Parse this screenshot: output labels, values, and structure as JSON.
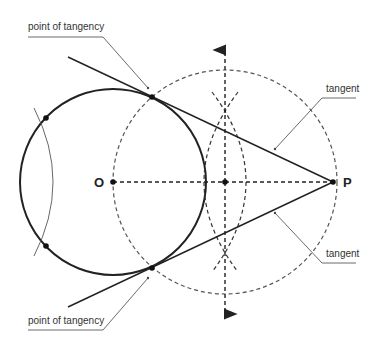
{
  "diagram": {
    "points": {
      "O": {
        "label": "O",
        "x": 113,
        "y": 182
      },
      "P": {
        "label": "P",
        "x": 333,
        "y": 182
      },
      "M": {
        "label": "",
        "x": 225,
        "y": 182
      },
      "T1": {
        "label": "",
        "x": 150,
        "y": 96
      },
      "T2": {
        "label": "",
        "x": 150,
        "y": 268
      },
      "A1": {
        "label": "",
        "x": 46,
        "y": 118
      },
      "A2": {
        "label": "",
        "x": 46,
        "y": 246
      }
    },
    "labels": {
      "point_of_tangency_top": "point of tangency",
      "point_of_tangency_bottom": "point of tangency",
      "tangent_top": "tangent",
      "tangent_bottom": "tangent",
      "O": "O",
      "P": "P"
    },
    "colors": {
      "stroke": "#222222",
      "dashed": "#555555",
      "leader": "#444444",
      "background": "#ffffff"
    }
  }
}
